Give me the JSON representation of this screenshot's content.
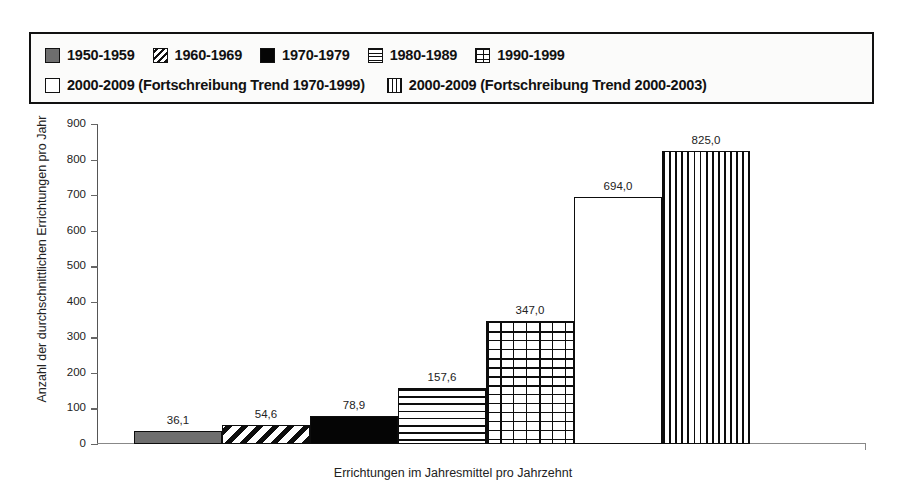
{
  "legend": {
    "rows": [
      [
        {
          "pattern": "solid-gray",
          "icon": "legend-swatch-solid-gray-icon",
          "label": "1950-1959"
        },
        {
          "pattern": "diagonal",
          "icon": "legend-swatch-diagonal-icon",
          "label": "1960-1969"
        },
        {
          "pattern": "solid-black",
          "icon": "legend-swatch-solid-black-icon",
          "label": "1970-1979"
        },
        {
          "pattern": "horizontal",
          "icon": "legend-swatch-horizontal-icon",
          "label": "1980-1989"
        },
        {
          "pattern": "brick",
          "icon": "legend-swatch-brick-icon",
          "label": "1990-1999"
        }
      ],
      [
        {
          "pattern": "empty",
          "icon": "legend-swatch-empty-icon",
          "label": "2000-2009  (Fortschreibung Trend 1970-1999)"
        },
        {
          "pattern": "vertical",
          "icon": "legend-swatch-vertical-icon",
          "label": "2000-2009  (Fortschreibung Trend 2000-2003)"
        }
      ]
    ]
  },
  "chart_data": {
    "type": "bar",
    "title": "",
    "subtitle": "",
    "xlabel": "Errichtungen im Jahresmittel pro Jahrzehnt",
    "ylabel": "Anzahl der durchschnittlichen Errichtungen pro Jahr",
    "ylim": [
      0,
      900
    ],
    "ytick_step": 100,
    "ytick_labels": [
      "900",
      "800",
      "700",
      "600",
      "500",
      "400",
      "300",
      "200",
      "100",
      "0"
    ],
    "ytick_values": [
      900,
      800,
      700,
      600,
      500,
      400,
      300,
      200,
      100,
      0
    ],
    "grid": false,
    "legend_position": "top",
    "bar_gap": 0,
    "categories": [
      "1950-1959",
      "1960-1969",
      "1970-1979",
      "1980-1989",
      "1990-1999",
      "2000-2009 (Fortschreibung Trend 1970-1999)",
      "2000-2009 (Fortschreibung Trend 2000-2003)"
    ],
    "values": [
      36.1,
      54.6,
      78.9,
      157.6,
      347.0,
      694.0,
      825.0
    ],
    "value_labels": [
      "36,1",
      "54,6",
      "78,9",
      "157,6",
      "347,0",
      "694,0",
      "825,0"
    ],
    "patterns": [
      "solid-gray",
      "diagonal",
      "solid-black",
      "horizontal",
      "brick",
      "empty",
      "vertical"
    ],
    "colors": {
      "bar_outline": "#0d0d0d",
      "bar_gray_fill": "#6e6e6e",
      "bar_black_fill": "#050505",
      "bar_white_fill": "#ffffff",
      "axis": "#666666",
      "text": "#222222",
      "background": "#ffffff"
    }
  }
}
